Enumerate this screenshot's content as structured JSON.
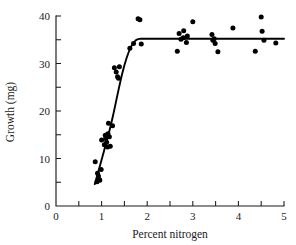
{
  "chart_data": {
    "type": "scatter",
    "title": "",
    "xlabel": "Percent nitrogen",
    "ylabel": "Growth (mg)",
    "xlim": [
      0,
      5
    ],
    "ylim": [
      0,
      40
    ],
    "grid": false,
    "legend": "none",
    "x_major_ticks": [
      0,
      1,
      2,
      3,
      4,
      5
    ],
    "x_minor_ticks": [
      0.5,
      1.5,
      2.5,
      3.5,
      4.5
    ],
    "x_tick_labels": [
      "0",
      "1",
      "2",
      "3",
      "4",
      "5"
    ],
    "y_major_ticks": [
      0,
      10,
      20,
      30,
      40
    ],
    "y_minor_ticks": [
      5,
      15,
      25,
      35
    ],
    "y_tick_labels": [
      "0",
      "10",
      "20",
      "30",
      "40"
    ],
    "marker": "filled-circle",
    "marker_color": "#000000",
    "fit_curve": {
      "name": "saturating growth fit",
      "description": "steep linear rise from about 0.85 to 1.8 percent nitrogen, then flat plateau at about 35 mg",
      "color": "#000000",
      "points": [
        [
          0.85,
          4.6
        ],
        [
          0.95,
          8.0
        ],
        [
          1.05,
          11.5
        ],
        [
          1.15,
          15.0
        ],
        [
          1.25,
          19.0
        ],
        [
          1.35,
          23.5
        ],
        [
          1.45,
          27.8
        ],
        [
          1.55,
          31.2
        ],
        [
          1.65,
          33.6
        ],
        [
          1.75,
          34.9
        ],
        [
          1.85,
          35.2
        ],
        [
          2.0,
          35.2
        ],
        [
          2.5,
          35.2
        ],
        [
          3.0,
          35.2
        ],
        [
          3.5,
          35.2
        ],
        [
          4.0,
          35.2
        ],
        [
          4.5,
          35.2
        ],
        [
          5.0,
          35.2
        ]
      ]
    },
    "points": [
      [
        0.86,
        9.3
      ],
      [
        0.9,
        5.1
      ],
      [
        0.91,
        6.9
      ],
      [
        0.93,
        6.3
      ],
      [
        0.95,
        5.6
      ],
      [
        0.96,
        5.4
      ],
      [
        0.99,
        7.7
      ],
      [
        1.0,
        13.9
      ],
      [
        1.06,
        12.9
      ],
      [
        1.08,
        14.9
      ],
      [
        1.09,
        14.2
      ],
      [
        1.11,
        13.4
      ],
      [
        1.13,
        12.4
      ],
      [
        1.14,
        15.2
      ],
      [
        1.15,
        17.4
      ],
      [
        1.17,
        14.6
      ],
      [
        1.19,
        12.6
      ],
      [
        1.24,
        16.9
      ],
      [
        1.28,
        29.1
      ],
      [
        1.32,
        28.2
      ],
      [
        1.35,
        27.2
      ],
      [
        1.37,
        26.9
      ],
      [
        1.39,
        29.3
      ],
      [
        1.62,
        33.2
      ],
      [
        1.7,
        34.2
      ],
      [
        1.8,
        39.4
      ],
      [
        1.84,
        39.2
      ],
      [
        1.87,
        34.1
      ],
      [
        2.66,
        32.6
      ],
      [
        2.7,
        36.3
      ],
      [
        2.74,
        35.1
      ],
      [
        2.79,
        35.4
      ],
      [
        2.8,
        36.9
      ],
      [
        2.86,
        34.4
      ],
      [
        2.88,
        35.8
      ],
      [
        3.0,
        38.8
      ],
      [
        3.42,
        36.1
      ],
      [
        3.44,
        34.9
      ],
      [
        3.47,
        35.2
      ],
      [
        3.49,
        34.2
      ],
      [
        3.55,
        32.5
      ],
      [
        3.88,
        37.5
      ],
      [
        4.37,
        32.6
      ],
      [
        4.5,
        39.8
      ],
      [
        4.52,
        36.8
      ],
      [
        4.56,
        34.9
      ],
      [
        4.82,
        34.3
      ]
    ]
  }
}
